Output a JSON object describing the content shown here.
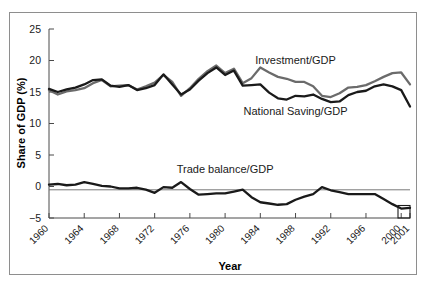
{
  "figure": {
    "background_color": "#ffffff",
    "frame_color": "#8e8e8e"
  },
  "chart_data": {
    "type": "line",
    "title": "",
    "xlabel": "Year",
    "ylabel": "Share of GDP (%)",
    "xlim": [
      1960,
      2001
    ],
    "ylim": [
      -5,
      25
    ],
    "yticks": [
      -5,
      0,
      5,
      10,
      15,
      20,
      25
    ],
    "ytick_labels": [
      "−5",
      "0",
      "5",
      "10",
      "15",
      "20",
      "25"
    ],
    "xticks": [
      1960,
      1964,
      1968,
      1972,
      1976,
      1980,
      1984,
      1988,
      1992,
      1996,
      2000,
      2001
    ],
    "xtick_labels": [
      "1960",
      "1964",
      "1968",
      "1972",
      "1976",
      "1980",
      "1984",
      "1988",
      "1992",
      "1996",
      "2000",
      "2001"
    ],
    "grid": false,
    "legend_position": "inline-annotations",
    "zero_line": true,
    "x": [
      1960,
      1961,
      1962,
      1963,
      1964,
      1965,
      1966,
      1967,
      1968,
      1969,
      1970,
      1971,
      1972,
      1973,
      1974,
      1975,
      1976,
      1977,
      1978,
      1979,
      1980,
      1981,
      1982,
      1983,
      1984,
      1985,
      1986,
      1987,
      1988,
      1989,
      1990,
      1991,
      1992,
      1993,
      1994,
      1995,
      1996,
      1997,
      1998,
      1999,
      2000,
      2001
    ],
    "series": [
      {
        "name": "Investment/GDP",
        "color": "#6b6b6b",
        "label_x": 1988,
        "label_y": 19.4,
        "values": [
          15.3,
          14.6,
          15.1,
          15.3,
          15.6,
          16.4,
          16.9,
          15.9,
          16.0,
          16.1,
          15.4,
          15.9,
          16.5,
          17.7,
          16.6,
          14.4,
          15.6,
          17.1,
          18.3,
          19.2,
          18.0,
          18.7,
          16.4,
          17.2,
          18.9,
          18.1,
          17.4,
          17.1,
          16.6,
          16.6,
          15.9,
          14.4,
          14.2,
          14.8,
          15.7,
          15.8,
          16.1,
          16.7,
          17.4,
          18.0,
          18.1,
          16.2
        ]
      },
      {
        "name": "National Saving/GDP",
        "color": "#1a1a1a",
        "label_x": 1988,
        "label_y": 11.4,
        "values": [
          15.5,
          15.0,
          15.4,
          15.7,
          16.2,
          16.9,
          17.0,
          16.0,
          15.8,
          16.1,
          15.3,
          15.6,
          16.1,
          17.8,
          16.2,
          14.6,
          15.4,
          16.8,
          18.0,
          18.9,
          17.7,
          18.4,
          16.0,
          16.1,
          16.2,
          14.9,
          14.0,
          13.8,
          14.4,
          14.3,
          14.6,
          13.9,
          13.4,
          13.5,
          14.5,
          15.0,
          15.2,
          15.9,
          16.2,
          15.9,
          15.3,
          12.7
        ]
      },
      {
        "name": "Trade balance/GDP",
        "color": "#1a1a1a",
        "label_x": 1980,
        "label_y": 2.1,
        "values": [
          0.3,
          0.4,
          0.2,
          0.3,
          0.7,
          0.4,
          0.1,
          0.0,
          -0.3,
          -0.3,
          -0.2,
          -0.5,
          -1.0,
          -0.1,
          -0.2,
          0.7,
          -0.4,
          -1.3,
          -1.2,
          -1.1,
          -1.1,
          -0.8,
          -0.5,
          -1.7,
          -2.5,
          -2.7,
          -2.9,
          -2.8,
          -2.1,
          -1.6,
          -1.2,
          -0.1,
          -0.6,
          -0.9,
          -1.2,
          -1.2,
          -1.2,
          -1.2,
          -2.0,
          -2.8,
          -3.5,
          -3.4
        ]
      }
    ]
  }
}
